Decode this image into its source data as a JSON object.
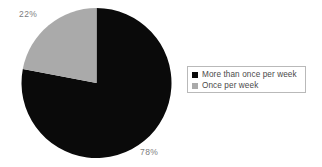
{
  "chart_data": {
    "type": "pie",
    "title": "",
    "categories": [
      "More than once per week",
      "Once per week"
    ],
    "values": [
      78,
      22
    ],
    "value_labels": [
      "78%",
      "22%"
    ],
    "colors": [
      "#0a0a0a",
      "#aaaaaa"
    ],
    "legend_position": "right",
    "start_angle_deg": 0,
    "direction": "clockwise",
    "units": "percent",
    "grid": false
  },
  "labels": {
    "gray_slice_percent": "22%",
    "black_slice_percent": "78%"
  },
  "legend": {
    "entries": [
      {
        "label": "More than once per week",
        "color": "#0a0a0a",
        "swatch_name": "legend-swatch-black"
      },
      {
        "label": "Once per week",
        "color": "#aaaaaa",
        "swatch_name": "legend-swatch-gray"
      }
    ]
  },
  "style": {
    "background": "#ffffff",
    "label_color": "#7d7d7d",
    "legend_text_color": "#4a4a4a",
    "legend_border_color": "#b9b9b9"
  }
}
